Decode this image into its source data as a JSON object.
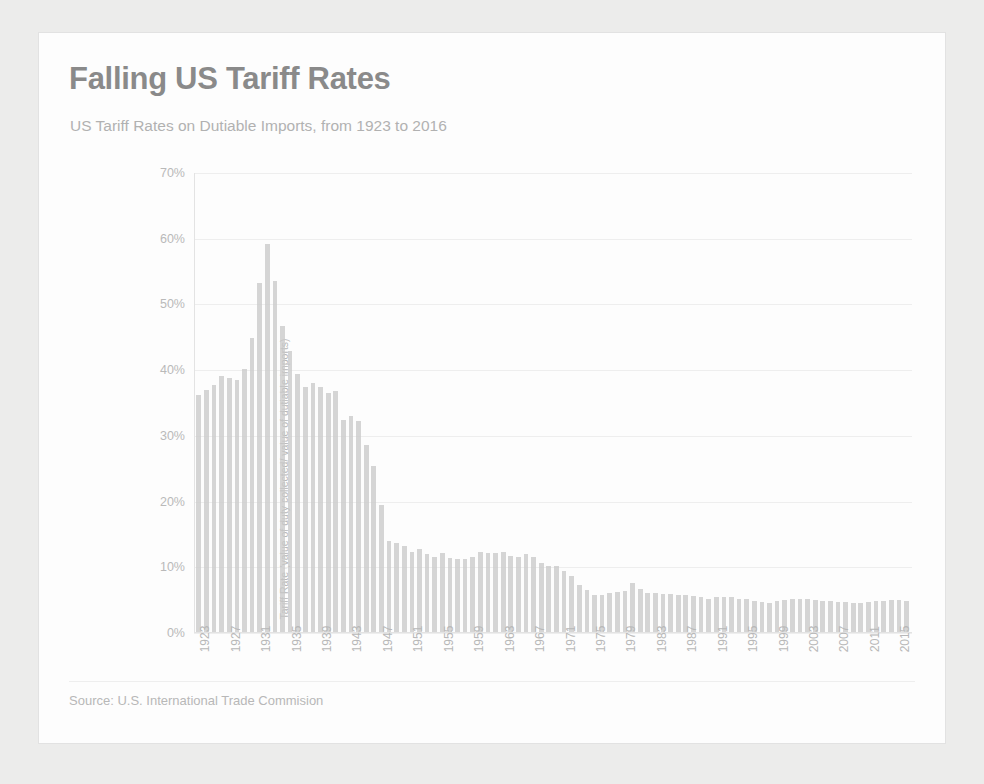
{
  "card": {
    "title": "Falling US Tariff Rates",
    "subtitle": "US Tariff Rates on Dutiable Imports, from 1923 to 2016",
    "source": "Source: U.S. International Trade Commision",
    "accent_color": "#7d7d7d",
    "bar_color": "#c2c2c2",
    "gridline_color": "#ededed"
  },
  "chart_data": {
    "type": "bar",
    "title": "Falling US Tariff Rates",
    "subtitle": "US Tariff Rates on Dutiable Imports, from 1923 to 2016",
    "xlabel": "",
    "ylabel": "Tariff Rate (value of duty collected/ value of dutiable imports)",
    "ylim": [
      0,
      70
    ],
    "yticks": [
      0,
      10,
      20,
      30,
      40,
      50,
      60,
      70
    ],
    "ytick_labels": [
      "0%",
      "10%",
      "20%",
      "30%",
      "40%",
      "50%",
      "60%",
      "70%"
    ],
    "xtick_labels": [
      "1923",
      "1927",
      "1931",
      "1935",
      "1939",
      "1943",
      "1947",
      "1951",
      "1955",
      "1959",
      "1963",
      "1967",
      "1971",
      "1975",
      "1979",
      "1983",
      "1987",
      "1991",
      "1995",
      "1999",
      "2003",
      "2007",
      "2011",
      "2015"
    ],
    "xtick_interval": 4,
    "grid": true,
    "legend": "none",
    "unit": "percent",
    "categories": [
      "1923",
      "1924",
      "1925",
      "1926",
      "1927",
      "1928",
      "1929",
      "1930",
      "1931",
      "1932",
      "1933",
      "1934",
      "1935",
      "1936",
      "1937",
      "1938",
      "1939",
      "1940",
      "1941",
      "1942",
      "1943",
      "1944",
      "1945",
      "1946",
      "1947",
      "1948",
      "1949",
      "1950",
      "1951",
      "1952",
      "1953",
      "1954",
      "1955",
      "1956",
      "1957",
      "1958",
      "1959",
      "1960",
      "1961",
      "1962",
      "1963",
      "1964",
      "1965",
      "1966",
      "1967",
      "1968",
      "1969",
      "1970",
      "1971",
      "1972",
      "1973",
      "1974",
      "1975",
      "1976",
      "1977",
      "1978",
      "1979",
      "1980",
      "1981",
      "1982",
      "1983",
      "1984",
      "1985",
      "1986",
      "1987",
      "1988",
      "1989",
      "1990",
      "1991",
      "1992",
      "1993",
      "1994",
      "1995",
      "1996",
      "1997",
      "1998",
      "1999",
      "2000",
      "2001",
      "2002",
      "2003",
      "2004",
      "2005",
      "2006",
      "2007",
      "2008",
      "2009",
      "2010",
      "2011",
      "2012",
      "2013",
      "2014",
      "2015",
      "2016"
    ],
    "values": [
      36.2,
      36.9,
      37.6,
      39.0,
      38.8,
      38.5,
      40.1,
      44.9,
      53.2,
      59.1,
      53.6,
      46.7,
      42.9,
      39.3,
      37.3,
      38.0,
      37.3,
      36.5,
      36.8,
      32.4,
      32.9,
      32.2,
      28.5,
      25.3,
      19.3,
      13.9,
      13.5,
      13.1,
      12.2,
      12.6,
      11.9,
      11.4,
      12.0,
      11.3,
      11.2,
      11.1,
      11.5,
      12.2,
      12.1,
      12.0,
      12.2,
      11.6,
      11.5,
      11.9,
      11.4,
      10.6,
      10.1,
      10.0,
      9.3,
      8.6,
      7.2,
      6.4,
      5.7,
      5.7,
      5.9,
      6.1,
      6.2,
      7.5,
      6.5,
      5.9,
      5.9,
      5.8,
      5.8,
      5.7,
      5.6,
      5.5,
      5.3,
      5.1,
      5.3,
      5.3,
      5.4,
      5.1,
      5.0,
      4.8,
      4.6,
      4.5,
      4.7,
      4.9,
      5.0,
      5.1,
      5.0,
      4.9,
      4.8,
      4.7,
      4.6,
      4.6,
      4.4,
      4.5,
      4.6,
      4.7,
      4.8,
      4.9,
      4.9,
      4.8
    ]
  }
}
